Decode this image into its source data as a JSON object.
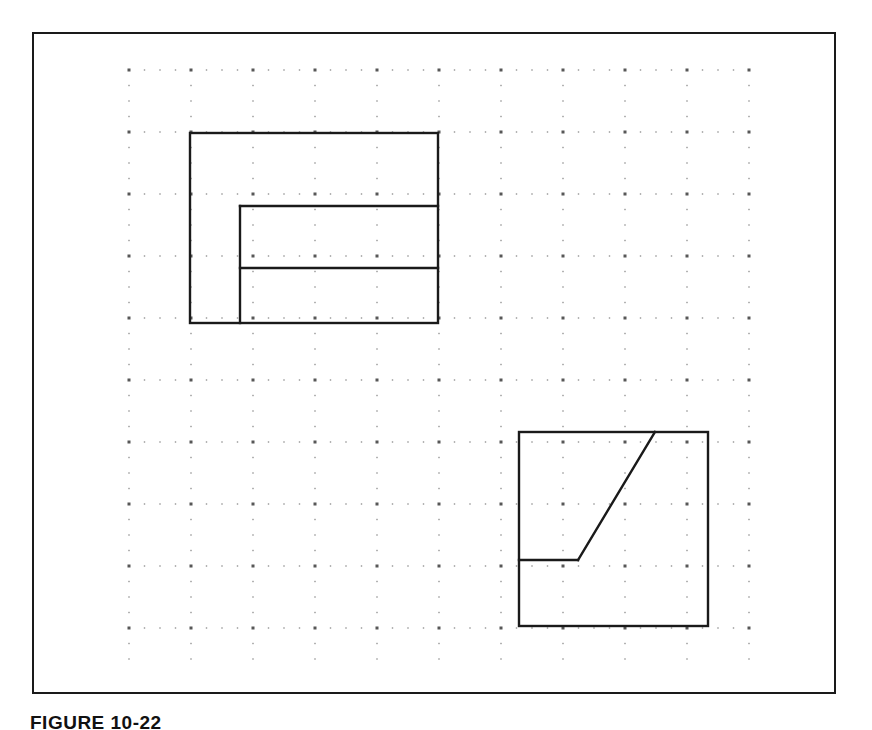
{
  "figure": {
    "caption": "FIGURE 10-22",
    "frame": {
      "x": 32,
      "y": 32,
      "width": 804,
      "height": 662,
      "border_color": "#1a1a1a",
      "border_width": 2
    },
    "background_color": "#ffffff",
    "line_color": "#1a1a1a",
    "dot_color": "#3a3a3a"
  },
  "grid": {
    "type": "dot-grid",
    "origin_x": 129,
    "origin_y": 70,
    "minor_spacing": 15.5,
    "major_every": 4,
    "cols": 41,
    "rows": 39,
    "minor_dot_size": 1.4,
    "major_dot_size": 2.4,
    "intersection_dot_size": 3.0
  },
  "shapes": [
    {
      "name": "upper-left-object",
      "type": "orthographic-view",
      "outline": {
        "x": 190,
        "y": 133,
        "width": 248,
        "height": 190
      },
      "internal_lines": [
        {
          "name": "upper-horizontal-line",
          "x1": 240,
          "y1": 206,
          "x2": 438,
          "y2": 206
        },
        {
          "name": "lower-horizontal-line",
          "x1": 240,
          "y1": 268,
          "x2": 438,
          "y2": 268
        },
        {
          "name": "vertical-line",
          "x1": 240,
          "y1": 206,
          "x2": 240,
          "y2": 323
        }
      ]
    },
    {
      "name": "lower-right-object",
      "type": "orthographic-view",
      "outline": {
        "x": 519,
        "y": 432,
        "width": 189,
        "height": 194
      },
      "internal_lines": [
        {
          "name": "horizontal-ledge-line",
          "x1": 519,
          "y1": 560,
          "x2": 578,
          "y2": 560
        },
        {
          "name": "inclined-surface-line",
          "x1": 578,
          "y1": 560,
          "x2": 655,
          "y2": 432
        }
      ]
    }
  ]
}
